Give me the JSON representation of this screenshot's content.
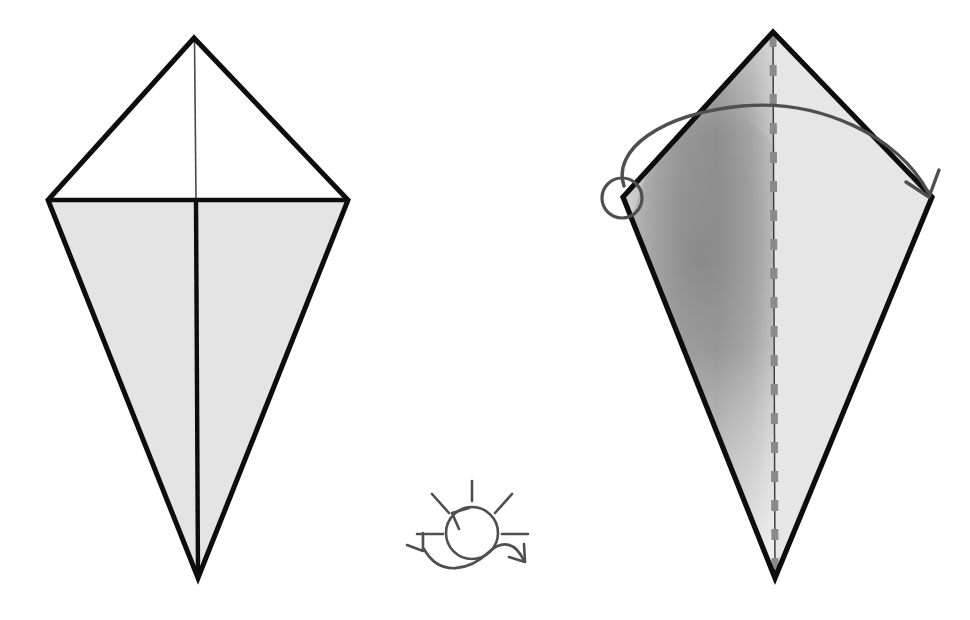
{
  "page": {
    "title": "Origami Fold Instruction Diagram",
    "background_color": "#ffffff",
    "width": 970,
    "height": 620
  },
  "palette": {
    "outline": "#0d0d0d",
    "paper_light": "#e4e4e4",
    "paper_white": "#ffffff",
    "shadow_gray": "#9b9b9b",
    "shadow_dark": "#7d7d7d",
    "symbol_gray": "#4f4f4f",
    "dash_gray": "#8a8a8a",
    "crease_thin": "#4a4a4a"
  },
  "panels": [
    {
      "id": "step-left",
      "name": "kite-base-flat",
      "caption": "",
      "shape": {
        "type": "kite",
        "top": [
          194,
          38
        ],
        "left": [
          48,
          200
        ],
        "right": [
          348,
          200
        ],
        "bottom": [
          198,
          578
        ]
      },
      "regions": [
        {
          "name": "upper-left-triangle",
          "fill": "#ffffff"
        },
        {
          "name": "upper-right-triangle",
          "fill": "#ffffff"
        },
        {
          "name": "lower-left-triangle",
          "fill": "#e4e4e4"
        },
        {
          "name": "lower-right-triangle",
          "fill": "#e4e4e4"
        }
      ],
      "creases": [
        {
          "name": "horizontal-crease",
          "style": "solid-thick",
          "from": [
            48,
            200
          ],
          "to": [
            348,
            200
          ]
        },
        {
          "name": "upper-vertical-crease",
          "style": "solid-thin",
          "from": [
            194,
            38
          ],
          "to": [
            196,
            200
          ]
        },
        {
          "name": "lower-vertical-crease",
          "style": "solid-thick",
          "from": [
            196,
            200
          ],
          "to": [
            198,
            578
          ]
        }
      ]
    },
    {
      "id": "step-right",
      "name": "kite-base-folded-with-valley",
      "caption": "",
      "shape": {
        "type": "kite",
        "top": [
          773,
          32
        ],
        "left": [
          623,
          197
        ],
        "right": [
          932,
          197
        ],
        "bottom": [
          775,
          578
        ]
      },
      "regions": [
        {
          "name": "left-half-shaded",
          "fill": "gradient-shadow"
        },
        {
          "name": "right-half-light",
          "fill": "#e4e4e4"
        }
      ],
      "creases": [
        {
          "name": "center-crease-thin",
          "style": "solid-thin",
          "from": [
            773,
            32
          ],
          "to": [
            775,
            578
          ]
        },
        {
          "name": "center-valley-fold-dashed",
          "style": "dashed-gray",
          "from": [
            773,
            34
          ],
          "to": [
            775,
            576
          ]
        }
      ],
      "annotations": [
        {
          "name": "rotate-origin-circle",
          "type": "circle",
          "cx": 622,
          "cy": 198,
          "r": 20
        },
        {
          "name": "fold-arc-arrow",
          "type": "arc",
          "from": [
            628,
            190
          ],
          "peak": [
            775,
            104
          ],
          "to": [
            928,
            196
          ]
        },
        {
          "name": "arc-arrowhead",
          "type": "arrowhead",
          "at": [
            928,
            196
          ],
          "direction": "down-right"
        }
      ]
    }
  ],
  "symbol": {
    "id": "turn-over-symbol",
    "name": "turn-model-over-sun-symbol",
    "center": [
      472,
      533
    ],
    "circle_radius": 26,
    "rays": [
      {
        "name": "ray-top",
        "from": [
          472,
          481
        ],
        "to": [
          472,
          501
        ]
      },
      {
        "name": "ray-upper-left",
        "from": [
          432,
          494
        ],
        "to": [
          449,
          513
        ]
      },
      {
        "name": "ray-upper-right",
        "from": [
          512,
          494
        ],
        "to": [
          495,
          513
        ]
      },
      {
        "name": "ray-left",
        "from": [
          417,
          534
        ],
        "to": [
          443,
          534
        ]
      },
      {
        "name": "ray-right",
        "from": [
          502,
          534
        ],
        "to": [
          528,
          534
        ]
      }
    ],
    "circle_arrowhead": {
      "name": "ccw-arrowhead",
      "at": [
        455,
        511
      ],
      "direction": "counter-clockwise"
    },
    "s_curve": {
      "name": "flip-s-curve",
      "start": [
        424,
        548
      ],
      "end": [
        524,
        562
      ],
      "left_arrowhead": {
        "at": [
          424,
          551
        ],
        "direction": "down-left"
      },
      "right_arrowhead": {
        "at": [
          524,
          562
        ],
        "direction": "down-right"
      }
    }
  }
}
